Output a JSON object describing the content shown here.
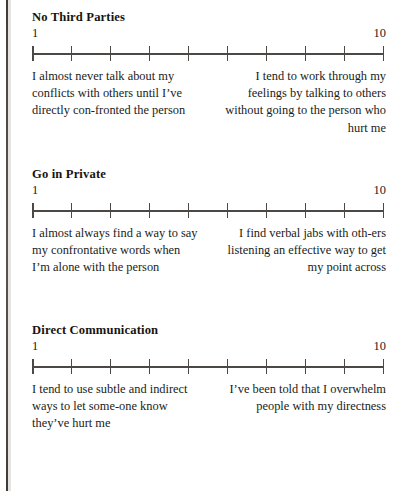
{
  "page": {
    "kind": "printed-book-page-scan",
    "scale_low_label": "1",
    "scale_high_label": "10",
    "tick_count": 10
  },
  "bleed_through": {
    "top": "",
    "bottom": ""
  },
  "sections": [
    {
      "title": "No Third Parties",
      "low": "1",
      "high": "10",
      "anchor_low": "I almost never talk about my conflicts with others until I’ve directly con-fronted the person",
      "anchor_high": "I tend to work through my feelings by talking to others without going to the person who hurt me"
    },
    {
      "title": "Go in Private",
      "low": "1",
      "high": "10",
      "anchor_low": "I almost always find a way to say my confrontative words when I’m alone with the person",
      "anchor_high": "I find verbal jabs with oth-ers listening an effective way to get my point across"
    },
    {
      "title": "Direct Communication",
      "low": "1",
      "high": "10",
      "anchor_low": "I tend to use subtle and indirect ways to let some-one know they’ve hurt me",
      "anchor_high": "I’ve been told that I overwhelm people with my directness"
    }
  ],
  "colors": {
    "ink": "#231f1d",
    "rule": "#4c4845",
    "paper": "#ffffff",
    "gutter": "#2c2926"
  }
}
